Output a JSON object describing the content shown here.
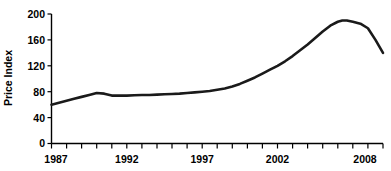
{
  "chart_data": {
    "type": "line",
    "title": "",
    "subtitle": "",
    "xlabel": "",
    "ylabel": "Price Index",
    "xlim": [
      1987,
      2009
    ],
    "ylim": [
      0,
      200
    ],
    "grid": false,
    "legend": false,
    "legend_position": "none",
    "y_ticks": [
      0,
      40,
      80,
      120,
      160,
      200
    ],
    "y_tick_labels": [
      "0",
      "40",
      "80",
      "120",
      "160",
      "200"
    ],
    "x_ticks": [
      1987,
      1988,
      1989,
      1990,
      1991,
      1992,
      1993,
      1994,
      1995,
      1996,
      1997,
      1998,
      1999,
      2000,
      2001,
      2002,
      2003,
      2004,
      2005,
      2006,
      2007,
      2008,
      2009
    ],
    "x_tick_labels_shown": [
      "1987",
      "1992",
      "1997",
      "2002",
      "2008"
    ],
    "x_labeled_ticks": [
      1987,
      1992,
      1997,
      2002,
      2008
    ],
    "series": [
      {
        "name": "Price Index",
        "color": "#1a1a1a",
        "x": [
          1987,
          1987.5,
          1988,
          1988.5,
          1989,
          1989.5,
          1990,
          1990.5,
          1991,
          1991.5,
          1992,
          1992.5,
          1993,
          1993.5,
          1994,
          1994.5,
          1995,
          1995.5,
          1996,
          1996.5,
          1997,
          1997.5,
          1998,
          1998.5,
          1999,
          1999.5,
          2000,
          2000.5,
          2001,
          2001.5,
          2002,
          2002.5,
          2003,
          2003.5,
          2004,
          2004.5,
          2005,
          2005.5,
          2006,
          2006.3,
          2006.6,
          2007,
          2007.5,
          2008,
          2008.5,
          2009
        ],
        "y": [
          60,
          63,
          66,
          69,
          72,
          75,
          78,
          77,
          74,
          74,
          74,
          74.5,
          75,
          75,
          75.5,
          76,
          76.5,
          77,
          78,
          79,
          80,
          81,
          83,
          85,
          88,
          92,
          97,
          102,
          108,
          114,
          120,
          127,
          135,
          144,
          153,
          163,
          173,
          182,
          188,
          190,
          190,
          188,
          185,
          178,
          160,
          140
        ]
      }
    ]
  },
  "axis": {
    "ylabel": "Price Index"
  }
}
